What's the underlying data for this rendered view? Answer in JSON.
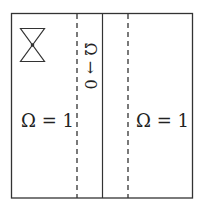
{
  "diagram": {
    "labels": {
      "left_region": "Ω = 1",
      "right_region": "Ω = 1",
      "center_strip": "Ω → 0"
    },
    "elements": {
      "outer_box": "square boundary",
      "left_dashed_line": "dashed vertical line",
      "center_solid_line": "solid vertical line",
      "right_dashed_line": "dashed vertical line",
      "hourglass_icon": "hourglass / double-triangle symbol with center dot"
    },
    "colors": {
      "stroke": "#333333",
      "background": "#ffffff"
    }
  }
}
